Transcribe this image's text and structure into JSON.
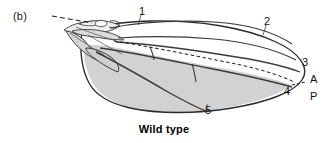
{
  "figure": {
    "panel_letter": "(b)",
    "caption": "Wild type",
    "colors": {
      "outline": "#2b2b2b",
      "vein": "#3a3a3a",
      "posterior_fill": "#d2d2d2",
      "anterior_fill": "#ffffff",
      "hinge_fill": "#e8e8e8",
      "boundary_dash": "#1a1a1a",
      "text": "#111111"
    }
  },
  "vein_labels": [
    {
      "id": "1",
      "text": "1",
      "x": 139,
      "y": 6
    },
    {
      "id": "2",
      "text": "2",
      "x": 264,
      "y": 16
    },
    {
      "id": "3",
      "text": "3",
      "x": 302,
      "y": 57
    },
    {
      "id": "4",
      "text": "4",
      "x": 284,
      "y": 86
    },
    {
      "id": "5",
      "text": "5",
      "x": 205,
      "y": 105
    }
  ],
  "compartment_labels": [
    {
      "id": "anterior",
      "text": "A",
      "x": 310,
      "y": 74
    },
    {
      "id": "posterior",
      "text": "P",
      "x": 310,
      "y": 91
    }
  ]
}
